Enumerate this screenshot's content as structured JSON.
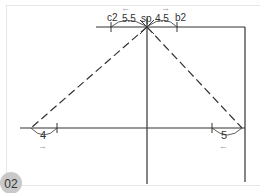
{
  "figure": {
    "badge": "02",
    "labels": {
      "top_left_point": "c2",
      "top_right_point": "b2",
      "apex_point": "sp",
      "top_left_length": "5.5",
      "top_right_length": "4.5",
      "bottom_left_length": "4",
      "bottom_right_length": "5"
    },
    "arrows": {
      "top_left": "←",
      "top_right": "→",
      "bottom_left": "→",
      "bottom_right": "←"
    },
    "colors": {
      "line": "#333333",
      "frame": "#e6e6e6",
      "arrow": "#999999",
      "badge": "#c9c9c9"
    }
  }
}
